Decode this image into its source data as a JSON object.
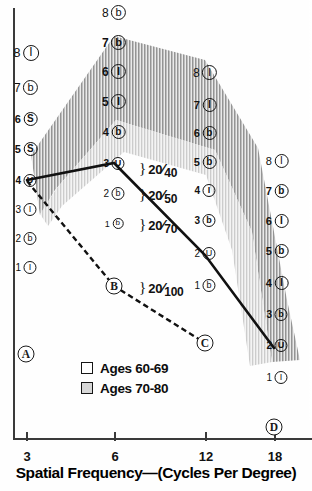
{
  "chart_data": {
    "type": "line",
    "title": "",
    "xlabel": "Spatial Frequency—(Cycles Per Degree)",
    "ylabel": "",
    "x_ticks": [
      "3",
      "6",
      "12",
      "18"
    ],
    "x_values": [
      3,
      6,
      12,
      18
    ],
    "xlim": [
      3,
      18
    ],
    "ylim": [
      0,
      9
    ],
    "grid": false,
    "legend_position": "bottom-center",
    "series": [
      {
        "name": "solid-curve",
        "style": "solid",
        "x": [
          3,
          6,
          12,
          18
        ],
        "values": [
          4.0,
          4.6,
          2.2,
          0.4
        ],
        "markers": [
          "",
          "",
          "",
          ""
        ]
      },
      {
        "name": "dashed-curve",
        "style": "dashed",
        "x": [
          3,
          6,
          12
        ],
        "values": [
          4.0,
          1.3,
          0.2
        ],
        "markers": [
          "",
          "B",
          "C"
        ]
      }
    ],
    "bands": [
      {
        "name": "Ages 60-69",
        "shade": "dark-hatched"
      },
      {
        "name": "Ages 70-80",
        "shade": "light-gray"
      }
    ],
    "point_markers": [
      {
        "label": "A",
        "x_px": 26,
        "y_px": 354
      },
      {
        "label": "B",
        "x_px": 114,
        "y_px": 286
      },
      {
        "label": "C",
        "x_px": 205,
        "y_px": 343
      },
      {
        "label": "D",
        "x_px": 274,
        "y_px": 427
      }
    ],
    "snellen_annotations": [
      {
        "numerator": "20",
        "denominator": "40",
        "x_px": 139,
        "y_px": 168
      },
      {
        "numerator": "20",
        "denominator": "50",
        "x_px": 139,
        "y_px": 194
      },
      {
        "numerator": "20",
        "denominator": "70",
        "x_px": 139,
        "y_px": 224
      },
      {
        "numerator": "20",
        "denominator": "100",
        "x_px": 139,
        "y_px": 287
      }
    ],
    "acuity_columns": [
      {
        "name": "column-left",
        "x_px": 26,
        "rows": [
          {
            "num": "8",
            "letter": "I",
            "y_px": 52,
            "size": 13,
            "bold": false
          },
          {
            "num": "7",
            "letter": "b",
            "y_px": 87,
            "size": 12,
            "bold": false
          },
          {
            "num": "6",
            "letter": "S",
            "y_px": 118,
            "size": 11,
            "bold": true
          },
          {
            "num": "5",
            "letter": "S",
            "y_px": 148,
            "size": 11,
            "bold": true
          },
          {
            "num": "4",
            "letter": "U",
            "y_px": 180,
            "size": 10,
            "bold": true
          },
          {
            "num": "3",
            "letter": "I",
            "y_px": 209,
            "size": 10,
            "bold": false
          },
          {
            "num": "2",
            "letter": "b",
            "y_px": 238,
            "size": 10,
            "bold": false
          },
          {
            "num": "1",
            "letter": "I",
            "y_px": 267,
            "size": 10,
            "bold": false
          }
        ]
      },
      {
        "name": "column-6cpd",
        "x_px": 114,
        "rows": [
          {
            "num": "8",
            "letter": "b",
            "y_px": 12,
            "size": 12,
            "bold": false
          },
          {
            "num": "7",
            "letter": "b",
            "y_px": 42,
            "size": 12,
            "bold": true
          },
          {
            "num": "6",
            "letter": "I",
            "y_px": 71,
            "size": 12,
            "bold": true
          },
          {
            "num": "5",
            "letter": "I",
            "y_px": 101,
            "size": 12,
            "bold": true
          },
          {
            "num": "4",
            "letter": "b",
            "y_px": 131,
            "size": 11,
            "bold": true
          },
          {
            "num": "3",
            "letter": "U",
            "y_px": 163,
            "size": 10,
            "bold": true
          },
          {
            "num": "2",
            "letter": "b",
            "y_px": 193,
            "size": 10,
            "bold": false
          },
          {
            "num": "1",
            "letter": "b",
            "y_px": 223,
            "size": 9,
            "bold": false
          }
        ]
      },
      {
        "name": "column-12cpd",
        "x_px": 205,
        "rows": [
          {
            "num": "8",
            "letter": "I",
            "y_px": 72,
            "size": 12,
            "bold": false
          },
          {
            "num": "7",
            "letter": "I",
            "y_px": 104,
            "size": 11,
            "bold": true
          },
          {
            "num": "6",
            "letter": "b",
            "y_px": 132,
            "size": 11,
            "bold": true
          },
          {
            "num": "5",
            "letter": "b",
            "y_px": 161,
            "size": 11,
            "bold": true
          },
          {
            "num": "4",
            "letter": "I",
            "y_px": 190,
            "size": 10,
            "bold": true
          },
          {
            "num": "3",
            "letter": "b",
            "y_px": 220,
            "size": 10,
            "bold": true
          },
          {
            "num": "2",
            "letter": "U",
            "y_px": 253,
            "size": 10,
            "bold": false
          },
          {
            "num": "1",
            "letter": "b",
            "y_px": 285,
            "size": 10,
            "bold": false
          }
        ]
      },
      {
        "name": "column-18cpd",
        "x_px": 277,
        "rows": [
          {
            "num": "8",
            "letter": "I",
            "y_px": 160,
            "size": 11,
            "bold": false
          },
          {
            "num": "7",
            "letter": "b",
            "y_px": 190,
            "size": 11,
            "bold": true
          },
          {
            "num": "6",
            "letter": "I",
            "y_px": 220,
            "size": 11,
            "bold": true
          },
          {
            "num": "5",
            "letter": "b",
            "y_px": 250,
            "size": 11,
            "bold": true
          },
          {
            "num": "4",
            "letter": "I",
            "y_px": 282,
            "size": 11,
            "bold": true
          },
          {
            "num": "3",
            "letter": "b",
            "y_px": 314,
            "size": 10,
            "bold": true
          },
          {
            "num": "2",
            "letter": "U",
            "y_px": 345,
            "size": 10,
            "bold": true
          },
          {
            "num": "1",
            "letter": "I",
            "y_px": 377,
            "size": 10,
            "bold": false
          }
        ]
      }
    ],
    "colors": {
      "axis": "#3a3a3a",
      "curve": "#111111",
      "band_dark": "#9a9a9a",
      "band_light": "#d7d7d7",
      "text": "#111111"
    }
  },
  "legend": {
    "items": [
      {
        "label": "Ages 60-69",
        "swatch": "#ffffff"
      },
      {
        "label": "Ages 70-80",
        "swatch": "#d7d7d7"
      }
    ]
  },
  "axis": {
    "x_title": "Spatial Frequency—(Cycles Per Degree)",
    "x_ticks": [
      "3",
      "6",
      "12",
      "18"
    ]
  }
}
